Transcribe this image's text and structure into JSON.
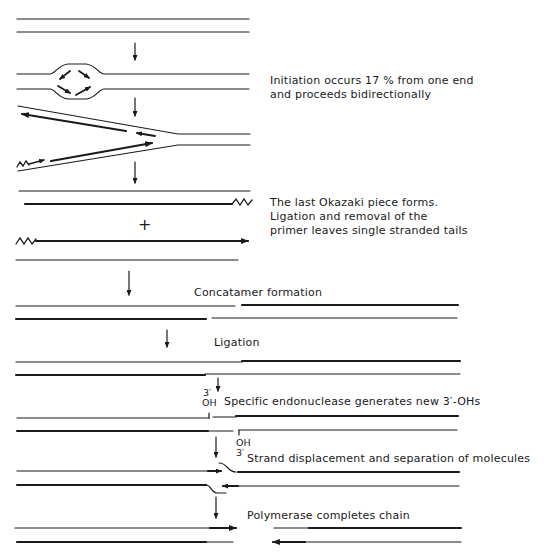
{
  "diagram": {
    "type": "dna-replication-schematic",
    "colors": {
      "ink": "#1a1a1a",
      "background": "#ffffff"
    },
    "steps": [
      {
        "id": "initiation",
        "label_lines": [
          "Initiation occurs 17 % from one end",
          "and proceeds bidirectionally"
        ]
      },
      {
        "id": "okazaki",
        "label_lines": [
          "The last Okazaki piece forms.",
          "Ligation and removal of the",
          "primer leaves single stranded tails"
        ]
      },
      {
        "id": "concatamer",
        "label": "Concatamer formation"
      },
      {
        "id": "ligation",
        "label": "Ligation"
      },
      {
        "id": "endonuclease",
        "label": "Specific endonuclease generates new 3′-OHs"
      },
      {
        "id": "displacement",
        "label": "Strand displacement and separation of molecules"
      },
      {
        "id": "polymerase",
        "label": "Polymerase completes chain"
      }
    ],
    "plus_sign": "+",
    "end_labels": {
      "top_prime": "3′",
      "top_oh": "OH",
      "bottom_oh": "OH",
      "bottom_prime": "3′"
    }
  }
}
